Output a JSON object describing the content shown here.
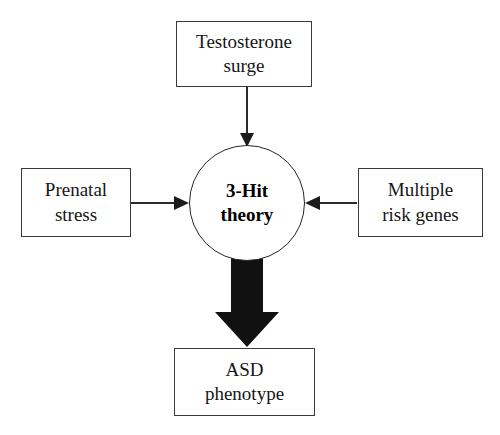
{
  "diagram": {
    "type": "flowchart",
    "background_color": "#ffffff",
    "line_color": "#2b2b2b",
    "text_color": "#161616",
    "nodes": {
      "testosterone": {
        "label": "Testosterone\nsurge",
        "shape": "rectangle",
        "role": "input"
      },
      "prenatal": {
        "label": "Prenatal\nstress",
        "shape": "rectangle",
        "role": "input"
      },
      "genes": {
        "label": "Multiple\nrisk genes",
        "shape": "rectangle",
        "role": "input"
      },
      "hub": {
        "label": "3-Hit\ntheory",
        "shape": "circle",
        "role": "hub"
      },
      "asd": {
        "label": "ASD\nphenotype",
        "shape": "rectangle",
        "role": "output"
      }
    },
    "edges": [
      {
        "id": "edge-testosterone-to-hub",
        "from": "testosterone",
        "to": "hub",
        "direction": "down",
        "style": "thin-arrow"
      },
      {
        "id": "edge-prenatal-to-hub",
        "from": "prenatal",
        "to": "hub",
        "direction": "right",
        "style": "thin-arrow"
      },
      {
        "id": "edge-genes-to-hub",
        "from": "genes",
        "to": "hub",
        "direction": "left",
        "style": "thin-arrow"
      },
      {
        "id": "edge-hub-to-asd",
        "from": "hub",
        "to": "asd",
        "direction": "down",
        "style": "thick-block-arrow"
      }
    ]
  }
}
